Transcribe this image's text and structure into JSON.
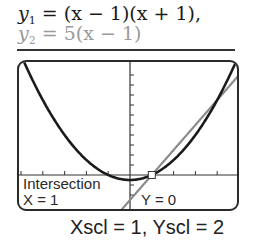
{
  "equations": {
    "y1": {
      "var": "y",
      "sub": "1",
      "rhs": " = (x − 1)(x + 1),",
      "color": "#1a1a1a"
    },
    "y2": {
      "var": "y",
      "sub": "2",
      "rhs": " = 5(x − 1)",
      "color": "#9a9a9a"
    }
  },
  "screen": {
    "label_intersection": "Intersection",
    "label_x": "X = 1",
    "label_y": "Y = 0"
  },
  "scale_caption": "Xscl = 1, Yscl = 2",
  "chart_data": {
    "type": "line",
    "title": "",
    "series": [
      {
        "name": "y1 = (x − 1)(x + 1)",
        "expression": "x^2 - 1",
        "color": "#1a1a1a"
      },
      {
        "name": "y2 = 5(x − 1)",
        "expression": "5x - 5",
        "color": "#8a8a8a"
      }
    ],
    "intersection": {
      "x": 1,
      "y": 0
    },
    "xscl": 1,
    "yscl": 2,
    "xlim": [
      -5,
      5
    ],
    "ylim": [
      -4,
      20
    ],
    "grid": false,
    "annotations": [
      "Intersection",
      "X = 1",
      "Y = 0"
    ]
  }
}
